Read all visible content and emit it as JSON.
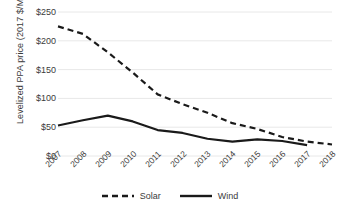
{
  "chart_data": {
    "type": "line",
    "title": "",
    "xlabel": "",
    "ylabel": "Levelized PPA price (2017 $/MWh)",
    "categories": [
      "2007",
      "2008",
      "2009",
      "2010",
      "2011",
      "2012",
      "2013",
      "2014",
      "2015",
      "2016",
      "2017",
      "2018"
    ],
    "series": [
      {
        "name": "Solar",
        "style": "dashed",
        "color": "#1a1a1a",
        "values": [
          225,
          212,
          180,
          145,
          107,
          90,
          75,
          57,
          47,
          33,
          25,
          20
        ]
      },
      {
        "name": "Wind",
        "style": "solid",
        "color": "#1a1a1a",
        "values": [
          53,
          62,
          70,
          60,
          45,
          40,
          30,
          25,
          29,
          26,
          19,
          null
        ]
      }
    ],
    "ylim": [
      0,
      250
    ],
    "ytick_values": [
      0,
      50,
      100,
      150,
      200,
      250
    ],
    "ytick_labels": [
      "$0",
      "$50",
      "$100",
      "$150",
      "$200",
      "$250"
    ],
    "grid": true,
    "grid_color": "#e8e8e8",
    "legend_position": "bottom",
    "xtick_rotation": -45
  },
  "axis": {
    "y_title": "Levelized PPA price (2017 $/MWh)"
  },
  "legend": {
    "entries": [
      {
        "label": "Solar"
      },
      {
        "label": "Wind"
      }
    ]
  }
}
